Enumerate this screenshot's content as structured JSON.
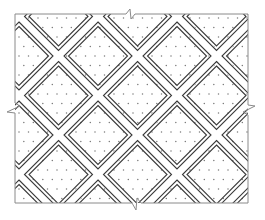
{
  "figure": {
    "type": "section-hatch-pattern",
    "frame": {
      "x": 15,
      "y": 14,
      "width": 233,
      "height": 189
    },
    "break_marks": [
      {
        "side": "top",
        "position": 130
      },
      {
        "side": "bottom",
        "position": 136
      },
      {
        "side": "left",
        "position": 108
      },
      {
        "side": "right",
        "position": 110
      }
    ],
    "lattice": {
      "period": 79,
      "origin_x": 98,
      "origin_y": 56,
      "outer_half_diagonal": 34,
      "inner_half_diagonal": 29.5
    },
    "dots": {
      "spacing": 9.5,
      "radius": 0.75
    },
    "colors": {
      "line": "#3a3a3a",
      "frame": "#8a8a8a",
      "dot": "#7a7a7a",
      "background": "#ffffff"
    }
  },
  "caption": {
    "text": "",
    "note": "caption cut off at image bottom edge; illegible"
  }
}
